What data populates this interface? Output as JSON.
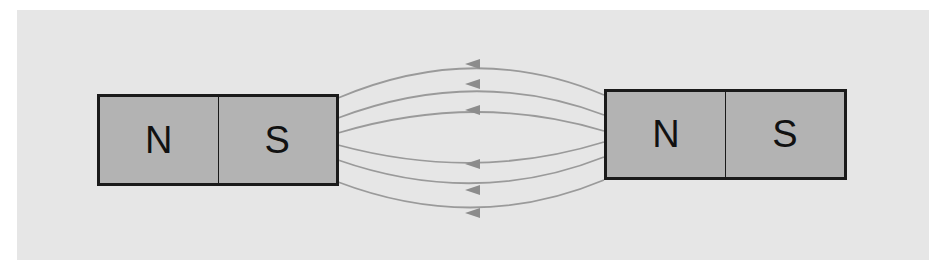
{
  "diagram": {
    "colors": {
      "background": "#e6e6e6",
      "magnet_fill": "#b3b3b3",
      "magnet_border": "#1a1a1a",
      "field_line": "#8c8c8c"
    },
    "left_magnet": {
      "poles": [
        {
          "label": "N"
        },
        {
          "label": "S"
        }
      ]
    },
    "right_magnet": {
      "poles": [
        {
          "label": "N"
        },
        {
          "label": "S"
        }
      ]
    },
    "field_lines": {
      "count": 6,
      "arrow_direction": "left"
    }
  }
}
